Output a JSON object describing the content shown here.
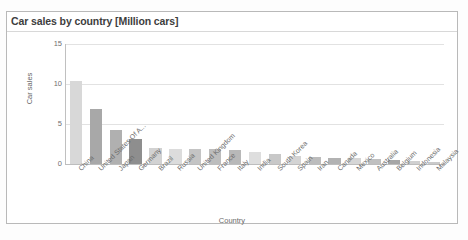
{
  "chart_data": {
    "type": "bar",
    "title": "Car sales by country [Million cars]",
    "xlabel": "Country",
    "ylabel": "Car sales",
    "ylim": [
      0,
      15
    ],
    "yticks": [
      0,
      5,
      10,
      15
    ],
    "grid": true,
    "legend": false,
    "categories": [
      "China",
      "United States Of A...",
      "Japan",
      "Germany",
      "Brazil",
      "Russia",
      "United Kingdom",
      "France",
      "Italy",
      "India",
      "South Korea",
      "Spain",
      "Iran",
      "Canada",
      "Mexico",
      "Australia",
      "Belgium",
      "Indonesia",
      "Malaysia"
    ],
    "values": [
      10.4,
      6.9,
      4.3,
      3.1,
      2.0,
      1.9,
      1.9,
      1.9,
      1.7,
      1.5,
      1.2,
      1.0,
      0.9,
      0.8,
      0.7,
      0.6,
      0.5,
      0.4,
      0.3
    ],
    "bar_colors": [
      "#d8d8d8",
      "#a8a8a8",
      "#b0b0b0",
      "#8e8e8e",
      "#d2d2d2",
      "#dcdcdc",
      "#c4c4c4",
      "#bdbdbd",
      "#b8b8b8",
      "#dedede",
      "#c8c8c8",
      "#d4d4d4",
      "#bcbcbc",
      "#b2b2b2",
      "#d6d6d6",
      "#c0c0c0",
      "#a6a6a6",
      "#d0d0d0",
      "#cacaca"
    ]
  },
  "colors": {
    "frame_border": "#b9b9b9",
    "gridline": "#e2e2e2",
    "axis": "#bdbdbd",
    "title_text": "#3d3d3d",
    "tick_text": "#6b6b6b"
  }
}
